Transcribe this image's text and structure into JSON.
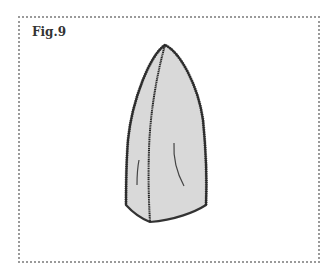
{
  "figure": {
    "label": "Fig.9",
    "colors": {
      "fill": "#d9d9d9",
      "stroke": "#333333",
      "frame_border": "#9a9a9a"
    }
  }
}
